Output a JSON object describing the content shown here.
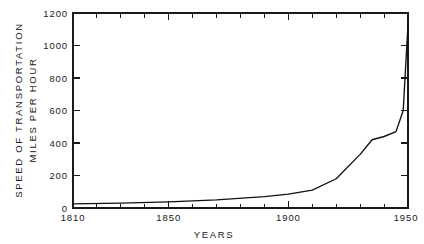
{
  "chart_data": {
    "type": "line",
    "title": "",
    "xlabel": "YEARS",
    "ylabel_line1": "SPEED OF TRANSPORTATION",
    "ylabel_line2": "MILES PER HOUR",
    "xlim": [
      1810,
      1950
    ],
    "ylim": [
      0,
      1200
    ],
    "grid": false,
    "legend": "none",
    "x_ticks_major": [
      1810,
      1850,
      1900,
      1950
    ],
    "x_tick_labels": [
      "1810",
      "1850",
      "1900",
      "1950"
    ],
    "x_ticks_minor": [
      1820,
      1830,
      1840,
      1860,
      1870,
      1880,
      1890,
      1910,
      1920,
      1930,
      1940
    ],
    "y_ticks": [
      0,
      200,
      400,
      600,
      800,
      1000,
      1200
    ],
    "y_tick_labels": [
      "0",
      "200",
      "400",
      "600",
      "800",
      "1000",
      "1200"
    ],
    "series": [
      {
        "name": "Speed of transportation",
        "color": "#111111",
        "x": [
          1810,
          1830,
          1850,
          1870,
          1890,
          1900,
          1910,
          1920,
          1930,
          1935,
          1940,
          1945,
          1948,
          1950
        ],
        "values": [
          25,
          30,
          38,
          50,
          70,
          85,
          110,
          180,
          330,
          420,
          440,
          470,
          600,
          1130
        ]
      }
    ]
  },
  "figure": {
    "background": "#ffffff",
    "ink_color": "#1a1a1a"
  }
}
